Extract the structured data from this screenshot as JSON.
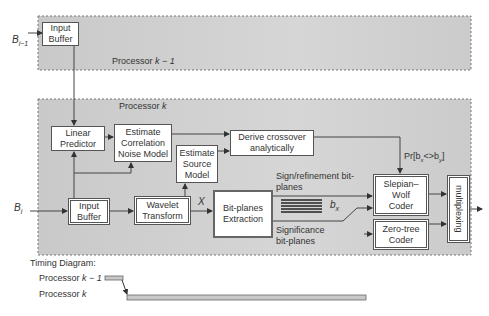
{
  "inputs": {
    "top": "B",
    "top_sub": "i−1",
    "bottom": "B",
    "bottom_sub": "i"
  },
  "processors": {
    "prev": {
      "label": "Processor",
      "var": "k − 1"
    },
    "curr": {
      "label": "Processor",
      "var": "k"
    }
  },
  "blocks": {
    "input_buffer_top": "Input Buffer",
    "linear_predictor": "Linear Predictor",
    "estimate_correlation": "Estimate Correlation Noise Model",
    "estimate_source": "Estimate Source Model",
    "derive_crossover": "Derive crossover analytically",
    "input_buffer_bottom": "Input Buffer",
    "wavelet_transform": "Wavelet Transform",
    "bitplanes_extraction": "Bit-planes Extraction",
    "slepian_wolf": "Slepian– Wolf Coder",
    "zero_tree": "Zero-tree Coder",
    "multiplexing": "multiplexing"
  },
  "annotations": {
    "x_label": "X",
    "bx_label": "b",
    "bx_sub": "x",
    "sign_refinement": "Sign/refinement bit-planes",
    "significance": "Significance bit-planes",
    "crossover_prob": "Pr[b",
    "crossover_prob_mid": "<>b",
    "crossover_prob_end": "]"
  },
  "timing": {
    "title": "Timing Diagram:",
    "rows": [
      {
        "label": "Processor",
        "var": "k − 1"
      },
      {
        "label": "Processor",
        "var": "k"
      }
    ]
  },
  "colors": {
    "panel_fill": "#cfcfcf",
    "line": "#444444",
    "bar_fill": "#c8c8c8"
  }
}
